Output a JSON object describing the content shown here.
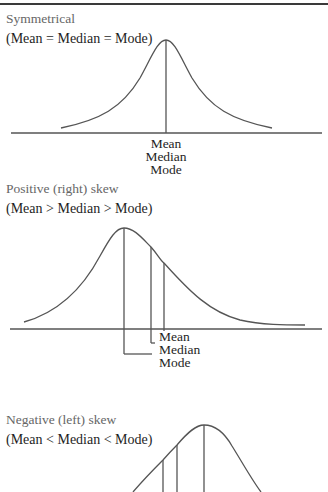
{
  "figure": {
    "sections": [
      {
        "id": "symmetrical",
        "title": "Symmetrical",
        "relation": "(Mean = Median = Mode)",
        "labels": [
          "Mean",
          "Median",
          "Mode"
        ]
      },
      {
        "id": "positive",
        "title": "Positive (right) skew",
        "relation": "(Mean > Median > Mode)",
        "labels": [
          "Mean",
          "Median",
          "Mode"
        ]
      },
      {
        "id": "negative",
        "title": "Negative (left) skew",
        "relation": "(Mean < Median < Mode)"
      }
    ],
    "colors": {
      "stroke": "#555555",
      "title_text": "#666666",
      "body_text": "#1e1e1e",
      "top_rule": "#3a3a3a"
    }
  }
}
